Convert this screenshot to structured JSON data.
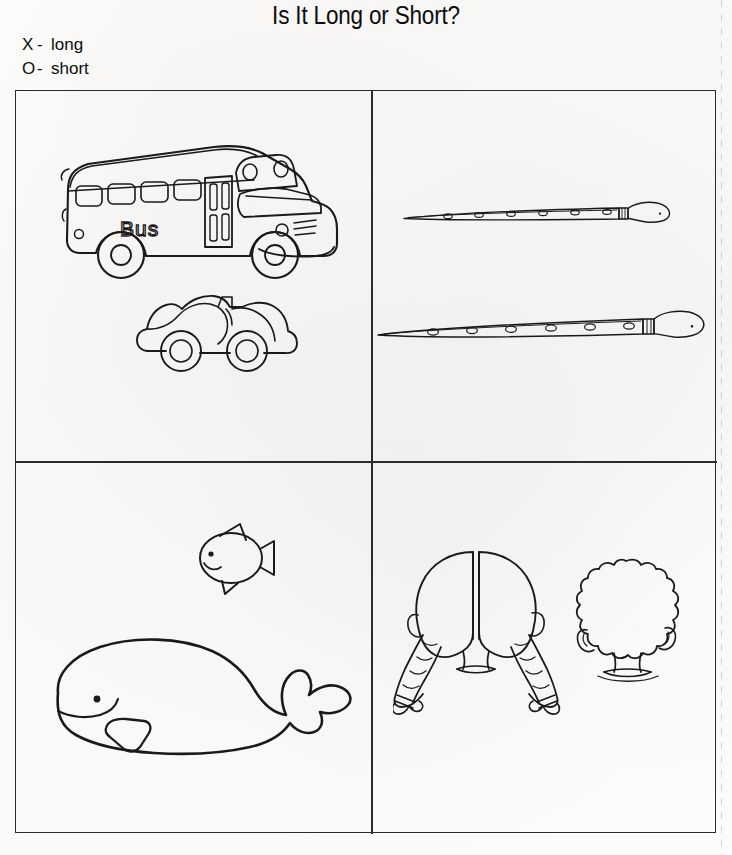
{
  "worksheet": {
    "title": "Is It Long or Short?",
    "legend": [
      {
        "symbol": "X",
        "dash": "-",
        "label": "long"
      },
      {
        "symbol": "O",
        "dash": "-",
        "label": "short"
      }
    ],
    "ink_color": "#1a1a1a",
    "border_color": "#2b2b2b",
    "background_color": "#fdfdfc"
  },
  "grid": {
    "rows": 2,
    "columns": 2,
    "cells": [
      {
        "position": "top-left",
        "theme": "vehicles",
        "items": [
          {
            "name": "school-bus",
            "label": "Bus",
            "expected_answer": "long",
            "side_text": "Bus"
          },
          {
            "name": "convertible-car",
            "label": "",
            "expected_answer": "short"
          }
        ]
      },
      {
        "position": "top-right",
        "theme": "flutes",
        "items": [
          {
            "name": "short-flute",
            "label": "",
            "expected_answer": "short",
            "holes": 6
          },
          {
            "name": "long-flute",
            "label": "",
            "expected_answer": "long",
            "holes": 6
          }
        ]
      },
      {
        "position": "bottom-left",
        "theme": "sea-animals",
        "items": [
          {
            "name": "fish",
            "label": "",
            "expected_answer": "short"
          },
          {
            "name": "whale",
            "label": "",
            "expected_answer": "long"
          }
        ]
      },
      {
        "position": "bottom-right",
        "theme": "hair",
        "items": [
          {
            "name": "long-braided-hair",
            "label": "",
            "expected_answer": "long"
          },
          {
            "name": "short-curly-hair",
            "label": "",
            "expected_answer": "short"
          }
        ]
      }
    ]
  }
}
